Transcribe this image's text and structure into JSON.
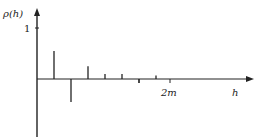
{
  "chart_data": {
    "type": "bar",
    "subtype": "stem",
    "title": "",
    "ylabel": "ρ(h)",
    "xlabel": "h",
    "y_ticks": [
      {
        "value": 1,
        "label": "1"
      }
    ],
    "x_ticks": [
      {
        "position": "2m",
        "label": "2m"
      }
    ],
    "note": "Autocorrelation function; spikes at lags 1..7 (lag 0 omitted), cuts off after lag m",
    "categories": [
      1,
      2,
      3,
      4,
      5,
      6,
      7
    ],
    "values": [
      0.55,
      -0.45,
      0.25,
      0.1,
      0.1,
      -0.08,
      0.07
    ],
    "ylim": [
      -1,
      1.1
    ],
    "grid": false,
    "legend": null
  },
  "labels": {
    "y_axis": "ρ(h)",
    "x_axis": "h",
    "y_one": "1",
    "x_2m": "2m"
  },
  "colors": {
    "axis": "#222222",
    "stem": "#222222"
  }
}
